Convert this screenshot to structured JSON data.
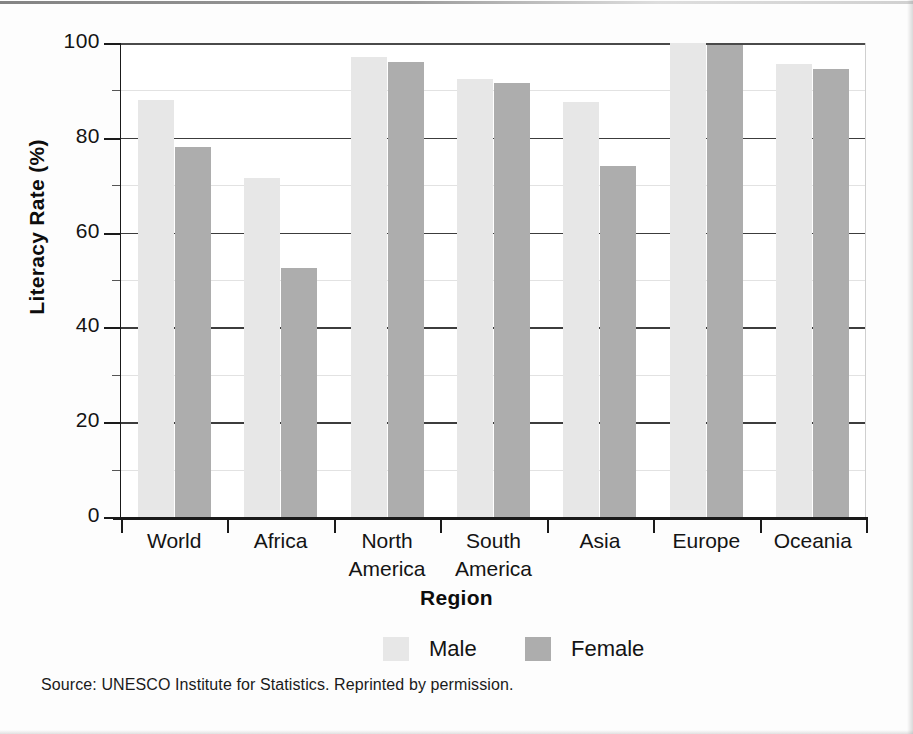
{
  "chart_data": {
    "type": "bar",
    "title": "",
    "xlabel": "Region",
    "ylabel": "Literacy Rate (%)",
    "ylim": [
      0,
      100
    ],
    "yticks": [
      0,
      20,
      40,
      60,
      80,
      100
    ],
    "ytick_labels": [
      "0",
      "20",
      "40",
      "60",
      "80",
      "100"
    ],
    "grid": true,
    "grid_minor_step": 10,
    "legend_position": "bottom-center",
    "categories": [
      "World",
      "Africa",
      "North America",
      "South America",
      "Asia",
      "Europe",
      "Oceania"
    ],
    "category_lines": [
      [
        "World"
      ],
      [
        "Africa"
      ],
      [
        "North",
        "America"
      ],
      [
        "South",
        "America"
      ],
      [
        "Asia"
      ],
      [
        "Europe"
      ],
      [
        "Oceania"
      ]
    ],
    "series": [
      {
        "name": "Male",
        "color": "#e7e7e7",
        "values": [
          88,
          71.5,
          97,
          92.5,
          87.5,
          100,
          95.5
        ]
      },
      {
        "name": "Female",
        "color": "#adadad",
        "values": [
          78,
          52.5,
          96,
          91.5,
          74,
          99.5,
          94.5
        ]
      }
    ]
  },
  "legend": {
    "items": [
      {
        "label": "Male",
        "color": "#e7e7e7"
      },
      {
        "label": "Female",
        "color": "#adadad"
      }
    ]
  },
  "source": {
    "text": "Source: UNESCO Institute for Statistics. Reprinted by permission."
  },
  "colors": {
    "male_bar": "#e7e7e7",
    "female_bar": "#adadad",
    "axis": "#1a1a1a",
    "major_gridline": "#3c3c3c",
    "minor_gridline": "#e2e2e2",
    "text": "#141414",
    "page_background": "#fdfdfd"
  }
}
